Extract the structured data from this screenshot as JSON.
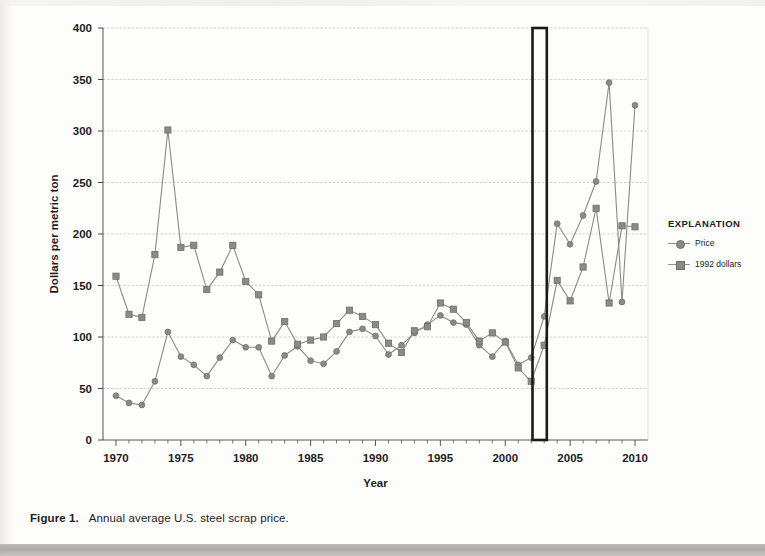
{
  "figure": {
    "number_label": "Figure 1.",
    "caption": "Annual average U.S. steel scrap price."
  },
  "legend": {
    "title": "EXPLANATION",
    "entries": [
      {
        "label": "Price",
        "marker": "circle",
        "color": "#8a8a8a"
      },
      {
        "label": "1992 dollars",
        "marker": "square",
        "color": "#8a8a8a"
      }
    ]
  },
  "chart_data": {
    "type": "line",
    "title": "Annual average U.S. steel scrap price.",
    "xlabel": "Year",
    "ylabel": "Dollars per metric ton",
    "xlim": [
      1969,
      2011
    ],
    "ylim": [
      0,
      400
    ],
    "ytick_step": 50,
    "yticks": [
      0,
      50,
      100,
      150,
      200,
      250,
      300,
      350,
      400
    ],
    "xticks": [
      1970,
      1975,
      1980,
      1985,
      1990,
      1995,
      2000,
      2005,
      2010
    ],
    "xtick_labels": [
      "1970",
      "1975",
      "1980",
      "1985",
      "1990",
      "1995",
      "2000",
      "2005",
      "2010"
    ],
    "minor_xtick_interval": 1,
    "grid": "horizontal",
    "legend_position": "right-outside",
    "x": [
      1970,
      1971,
      1972,
      1973,
      1974,
      1975,
      1976,
      1977,
      1978,
      1979,
      1980,
      1981,
      1982,
      1983,
      1984,
      1985,
      1986,
      1987,
      1988,
      1989,
      1990,
      1991,
      1992,
      1993,
      1994,
      1995,
      1996,
      1997,
      1998,
      1999,
      2000,
      2001,
      2002,
      2003,
      2004,
      2005,
      2006,
      2007,
      2008,
      2009,
      2010
    ],
    "series": [
      {
        "name": "Price",
        "marker": "circle",
        "color": "#8a8a8a",
        "values": [
          43,
          36,
          34,
          57,
          105,
          81,
          73,
          62,
          80,
          97,
          90,
          90,
          62,
          82,
          91,
          77,
          74,
          86,
          105,
          108,
          101,
          83,
          92,
          104,
          112,
          121,
          114,
          112,
          92,
          81,
          96,
          73,
          80,
          120,
          210,
          190,
          218,
          251,
          347,
          134,
          325
        ]
      },
      {
        "name": "1992 dollars",
        "marker": "square",
        "color": "#8a8a8a",
        "values": [
          159,
          122,
          119,
          180,
          301,
          187,
          189,
          146,
          163,
          189,
          154,
          141,
          96,
          115,
          93,
          97,
          100,
          113,
          126,
          120,
          112,
          94,
          85,
          106,
          110,
          133,
          127,
          114,
          96,
          104,
          95,
          70,
          57,
          92,
          155,
          135,
          168,
          225,
          133,
          208,
          207
        ]
      }
    ],
    "annotations": [
      {
        "type": "rectangle",
        "name": "highlight-box",
        "x_start": 2002.1,
        "x_end": 2003.2,
        "y_start": 0,
        "y_end": 400,
        "stroke": "#1a1a1a",
        "fill": "none"
      }
    ]
  }
}
